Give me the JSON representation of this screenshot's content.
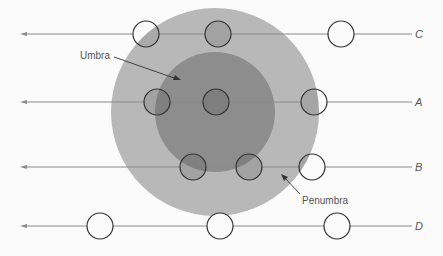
{
  "diagram": {
    "colors": {
      "background": "#fbfbfb",
      "penumbra": "#b8b8b8",
      "umbra": "#8d8d8d",
      "line": "#8a8a8a",
      "moon_stroke": "#333333"
    },
    "shadow": {
      "center": [
        215,
        112
      ],
      "penumbra_radius": 104,
      "umbra_radius": 60
    },
    "labels": {
      "umbra": "Umbra",
      "penumbra": "Penumbra"
    },
    "paths": [
      {
        "label": "C",
        "y": 34,
        "moons": [
          146,
          218,
          341
        ]
      },
      {
        "label": "A",
        "y": 102,
        "moons": [
          157,
          216,
          314
        ]
      },
      {
        "label": "B",
        "y": 167,
        "moons": [
          193,
          249,
          312
        ]
      },
      {
        "label": "D",
        "y": 226,
        "moons": [
          100,
          220,
          337
        ]
      }
    ]
  }
}
